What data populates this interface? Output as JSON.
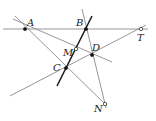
{
  "diagram": {
    "type": "geometry-construction",
    "points": [
      {
        "id": "A",
        "label": "A",
        "style": "filled"
      },
      {
        "id": "B",
        "label": "B",
        "style": "filled"
      },
      {
        "id": "T",
        "label": "T",
        "style": "open"
      },
      {
        "id": "M",
        "label": "M",
        "style": "open"
      },
      {
        "id": "D",
        "label": "D",
        "style": "filled"
      },
      {
        "id": "C",
        "label": "C",
        "style": "filled"
      },
      {
        "id": "N",
        "label": "N",
        "style": "open"
      }
    ],
    "lines": [
      {
        "id": "line-ABT",
        "through": [
          "A",
          "B",
          "T"
        ],
        "style": "thin"
      },
      {
        "id": "line-AMD",
        "through": [
          "A",
          "M"
        ],
        "style": "thin"
      },
      {
        "id": "line-ACN",
        "through": [
          "A",
          "C",
          "N"
        ],
        "style": "thin"
      },
      {
        "id": "line-BDN",
        "through": [
          "B",
          "D",
          "N"
        ],
        "style": "thin"
      },
      {
        "id": "line-BMC",
        "through": [
          "B",
          "M",
          "C"
        ],
        "style": "thick"
      },
      {
        "id": "line-TDC",
        "through": [
          "T",
          "D",
          "C"
        ],
        "style": "thin"
      }
    ]
  }
}
